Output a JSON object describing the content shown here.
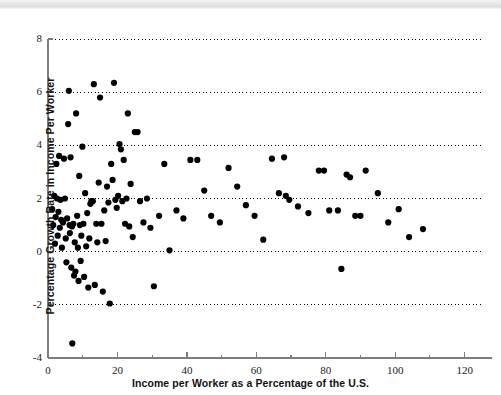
{
  "page": {
    "top_band_ghost_text": "",
    "background_color": "#ffffff"
  },
  "chart_data": {
    "type": "scatter",
    "title": "",
    "subtitle": "",
    "xlabel": "Income per Worker as a Percentage of the U.S.",
    "ylabel": "Percentage Growth Rate in Income Per Worker",
    "xlim": [
      0,
      125
    ],
    "ylim": [
      -4,
      8
    ],
    "xticks": [
      0,
      20,
      40,
      60,
      80,
      100,
      120
    ],
    "xticklabels": [
      "0",
      "20",
      "40",
      "60",
      "80",
      "100",
      "120"
    ],
    "x_minor_ticks": [
      10,
      30,
      50,
      70,
      90,
      110
    ],
    "yticks": [
      -4,
      -2,
      0,
      2,
      4,
      6,
      8
    ],
    "yticklabels": [
      "-4",
      "-2",
      "0",
      "2",
      "4",
      "6",
      "8"
    ],
    "grid": "horizontal-dotted",
    "gridlines_y": [
      -2,
      0,
      2,
      4,
      6,
      8
    ],
    "grid_color": "#000000",
    "axis_color": "#7d7d7d",
    "marker_color": "#000000",
    "marker_size": 4.2,
    "legend": null,
    "legend_position": "none",
    "annotations": [],
    "points": [
      [
        1.2,
        1.6
      ],
      [
        1.5,
        1.0
      ],
      [
        1.8,
        2.1
      ],
      [
        2.0,
        0.3
      ],
      [
        2.2,
        1.3
      ],
      [
        2.4,
        3.3
      ],
      [
        2.6,
        2.0
      ],
      [
        2.8,
        0.6
      ],
      [
        3.0,
        1.5
      ],
      [
        3.2,
        3.6
      ],
      [
        3.4,
        0.9
      ],
      [
        3.6,
        1.95
      ],
      [
        3.8,
        1.2
      ],
      [
        4.0,
        0.15
      ],
      [
        4.3,
        1.1
      ],
      [
        4.6,
        3.5
      ],
      [
        4.9,
        2.0
      ],
      [
        5.1,
        0.5
      ],
      [
        5.3,
        -0.4
      ],
      [
        5.5,
        1.25
      ],
      [
        5.8,
        4.8
      ],
      [
        6.0,
        6.05
      ],
      [
        6.2,
        1.0
      ],
      [
        6.3,
        0.7
      ],
      [
        6.5,
        3.55
      ],
      [
        6.7,
        -0.6
      ],
      [
        6.9,
        0.95
      ],
      [
        7.0,
        -3.45
      ],
      [
        7.3,
        1.05
      ],
      [
        7.5,
        -0.9
      ],
      [
        7.7,
        0.35
      ],
      [
        7.9,
        -0.75
      ],
      [
        8.1,
        5.2
      ],
      [
        8.4,
        1.35
      ],
      [
        8.6,
        0.15
      ],
      [
        8.8,
        -1.1
      ],
      [
        9.0,
        2.85
      ],
      [
        9.2,
        1.0
      ],
      [
        9.4,
        -0.35
      ],
      [
        9.6,
        0.6
      ],
      [
        9.9,
        3.95
      ],
      [
        10.2,
        1.05
      ],
      [
        10.4,
        -0.95
      ],
      [
        10.7,
        2.2
      ],
      [
        11.0,
        0.2
      ],
      [
        11.3,
        1.45
      ],
      [
        11.6,
        -1.35
      ],
      [
        11.9,
        0.5
      ],
      [
        12.2,
        1.8
      ],
      [
        12.5,
        1.9
      ],
      [
        12.9,
        1.9
      ],
      [
        13.2,
        6.3
      ],
      [
        13.5,
        -1.25
      ],
      [
        13.9,
        1.05
      ],
      [
        14.2,
        0.35
      ],
      [
        14.6,
        2.6
      ],
      [
        15.0,
        5.8
      ],
      [
        15.4,
        1.05
      ],
      [
        15.8,
        -1.5
      ],
      [
        16.2,
        1.55
      ],
      [
        16.6,
        0.4
      ],
      [
        17.0,
        2.45
      ],
      [
        17.4,
        1.85
      ],
      [
        17.8,
        -1.95
      ],
      [
        18.2,
        3.3
      ],
      [
        18.6,
        2.7
      ],
      [
        19.0,
        6.35
      ],
      [
        19.4,
        1.95
      ],
      [
        19.8,
        1.65
      ],
      [
        20.2,
        2.1
      ],
      [
        20.6,
        4.05
      ],
      [
        21.0,
        3.85
      ],
      [
        21.4,
        1.9
      ],
      [
        21.8,
        3.45
      ],
      [
        22.2,
        1.05
      ],
      [
        22.6,
        2.0
      ],
      [
        23.0,
        5.2
      ],
      [
        23.4,
        0.95
      ],
      [
        23.8,
        2.55
      ],
      [
        24.4,
        0.55
      ],
      [
        25.0,
        4.5
      ],
      [
        25.8,
        4.5
      ],
      [
        26.5,
        1.9
      ],
      [
        27.5,
        1.1
      ],
      [
        28.5,
        2.0
      ],
      [
        29.5,
        0.9
      ],
      [
        30.5,
        -1.3
      ],
      [
        32.0,
        1.35
      ],
      [
        33.5,
        3.3
      ],
      [
        35.0,
        0.05
      ],
      [
        37.0,
        1.55
      ],
      [
        39.0,
        1.25
      ],
      [
        41.0,
        3.45
      ],
      [
        43.0,
        3.45
      ],
      [
        45.0,
        2.3
      ],
      [
        47.0,
        1.35
      ],
      [
        49.5,
        1.1
      ],
      [
        52.0,
        3.15
      ],
      [
        54.5,
        2.45
      ],
      [
        57.0,
        1.75
      ],
      [
        59.5,
        1.35
      ],
      [
        62.0,
        0.45
      ],
      [
        64.5,
        3.5
      ],
      [
        66.5,
        2.2
      ],
      [
        68.0,
        3.55
      ],
      [
        68.5,
        2.1
      ],
      [
        69.5,
        1.95
      ],
      [
        72.0,
        1.7
      ],
      [
        75.0,
        1.45
      ],
      [
        78.0,
        3.05
      ],
      [
        79.5,
        3.05
      ],
      [
        81.0,
        1.55
      ],
      [
        83.5,
        1.55
      ],
      [
        84.5,
        -0.65
      ],
      [
        86.0,
        2.9
      ],
      [
        87.0,
        2.8
      ],
      [
        88.5,
        1.35
      ],
      [
        90.0,
        1.35
      ],
      [
        91.5,
        3.05
      ],
      [
        95.0,
        2.2
      ],
      [
        98.0,
        1.1
      ],
      [
        101.0,
        1.6
      ],
      [
        104.0,
        0.55
      ],
      [
        108.0,
        0.85
      ]
    ]
  }
}
